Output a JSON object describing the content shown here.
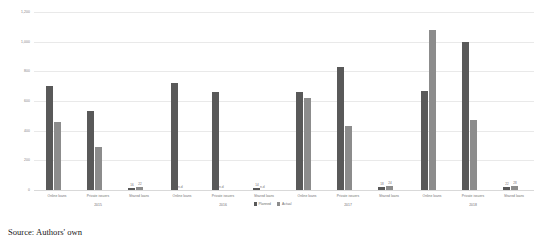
{
  "source_note": "Source: Authors' own",
  "chart_data": {
    "type": "bar",
    "title": "",
    "subtitle": "",
    "xlabel": "",
    "ylabel": "",
    "ylim": [
      0,
      1200
    ],
    "ytick_labels": [
      "1,200",
      "1,000",
      "800",
      "600",
      "400",
      "200",
      "0"
    ],
    "ytick_values": [
      1200,
      1000,
      800,
      600,
      400,
      200,
      0
    ],
    "grid": true,
    "legend_position": "bottom-center",
    "legend": [
      "Planned",
      "Actual"
    ],
    "series_colors": [
      "#595959",
      "#8c8c8c"
    ],
    "group_labels": [
      "2015",
      "2016",
      "2017",
      "2018"
    ],
    "categories": [
      "Online loans",
      "Private issuers",
      "Shared loans"
    ],
    "no_data_label": "n.d",
    "groups": [
      {
        "year": "2015",
        "bars": [
          {
            "category": "Online loans",
            "values": [
              700,
              460
            ],
            "labels": [
              "",
              ""
            ]
          },
          {
            "category": "Private issuers",
            "values": [
              530,
              290
            ],
            "labels": [
              "",
              ""
            ]
          },
          {
            "category": "Shared loans",
            "values": [
              16,
              22
            ],
            "labels": [
              "16",
              "22"
            ]
          }
        ]
      },
      {
        "year": "2016",
        "bars": [
          {
            "category": "Online loans",
            "values": [
              720,
              null
            ],
            "labels": [
              "",
              "n.d"
            ]
          },
          {
            "category": "Private issuers",
            "values": [
              660,
              null
            ],
            "labels": [
              "",
              "n.d"
            ]
          },
          {
            "category": "Shared loans",
            "values": [
              14,
              null
            ],
            "labels": [
              "14",
              "n.d"
            ]
          }
        ]
      },
      {
        "year": "2017",
        "bars": [
          {
            "category": "Online loans",
            "values": [
              660,
              620
            ],
            "labels": [
              "",
              ""
            ]
          },
          {
            "category": "Private issuers",
            "values": [
              830,
              430
            ],
            "labels": [
              "",
              ""
            ]
          },
          {
            "category": "Shared loans",
            "values": [
              18,
              24
            ],
            "labels": [
              "18",
              "24"
            ]
          }
        ]
      },
      {
        "year": "2018",
        "bars": [
          {
            "category": "Online loans",
            "values": [
              670,
              1080
            ],
            "labels": [
              "",
              ""
            ]
          },
          {
            "category": "Private issuers",
            "values": [
              1000,
              470
            ],
            "labels": [
              "",
              ""
            ]
          },
          {
            "category": "Shared loans",
            "values": [
              22,
              28
            ],
            "labels": [
              "22",
              "28"
            ]
          }
        ]
      }
    ]
  }
}
